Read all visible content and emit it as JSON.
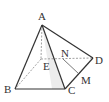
{
  "diagram": {
    "type": "solid-geometry-pyramid",
    "points": {
      "A": {
        "label": "A",
        "x": 42,
        "y": 25,
        "lx": 38,
        "ly": 11
      },
      "E": {
        "label": "E",
        "x": 41,
        "y": 59,
        "lx": 43,
        "ly": 61
      },
      "B": {
        "label": "B",
        "x": 15,
        "y": 89,
        "lx": 4,
        "ly": 84
      },
      "C": {
        "label": "C",
        "x": 65,
        "y": 89,
        "lx": 68,
        "ly": 85
      },
      "D": {
        "label": "D",
        "x": 93,
        "y": 58,
        "lx": 95,
        "ly": 55
      },
      "N": {
        "label": "N",
        "x": 63,
        "y": 59,
        "lx": 61,
        "ly": 48
      },
      "M": {
        "label": "M",
        "x": 79,
        "y": 74,
        "lx": 81,
        "ly": 75
      }
    },
    "solid_edges": [
      "AB",
      "AC",
      "BC",
      "AD",
      "CD",
      "NM"
    ],
    "dashed_edges": [
      "AE",
      "EB",
      "ED"
    ],
    "colors": {
      "line": "#333333",
      "dashed": "#888888",
      "shade": "#e6e6e6"
    }
  }
}
